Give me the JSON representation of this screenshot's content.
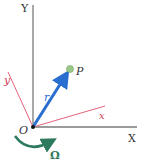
{
  "diagram": {
    "type": "rotating-reference-frame",
    "labels": {
      "fixed_y_axis": "Y",
      "fixed_x_axis": "X",
      "rotating_y_axis": "y",
      "rotating_x_axis": "x",
      "origin": "O",
      "point": "P",
      "position_vector": "r",
      "angular_velocity": "Ω"
    },
    "colors": {
      "fixed_axes": "#7a7a7a",
      "rotating_axes": "#e0506a",
      "rotating_labels": "#d0405a",
      "vector": "#2a6fcf",
      "point": "#9cc98a",
      "omega_arrow": "#2e7a5e",
      "text": "#333333"
    }
  }
}
